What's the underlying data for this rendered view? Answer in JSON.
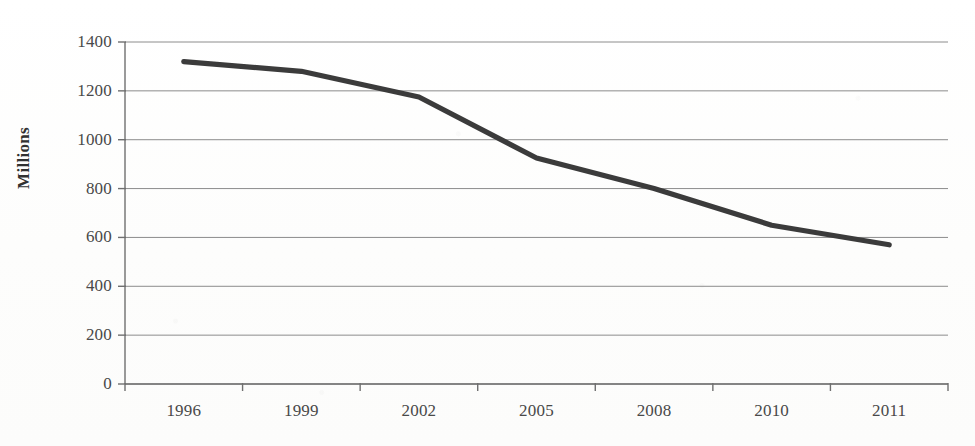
{
  "chart_data": {
    "type": "line",
    "title": "",
    "subtitle": "",
    "xlabel": "",
    "ylabel": "Millions",
    "categories": [
      "1996",
      "1999",
      "2002",
      "2005",
      "2008",
      "2010",
      "2011"
    ],
    "values": [
      1320,
      1280,
      1175,
      925,
      800,
      650,
      570
    ],
    "series": [
      {
        "name": "Millions",
        "values": [
          1320,
          1280,
          1175,
          925,
          800,
          650,
          570
        ]
      }
    ],
    "ylim": [
      0,
      1400
    ],
    "yticks": [
      0,
      200,
      400,
      600,
      800,
      1000,
      1200,
      1400
    ],
    "ytick_labels": [
      "0",
      "200",
      "400",
      "600",
      "800",
      "1000",
      "1200",
      "1400"
    ],
    "xtick_labels": [
      "1996",
      "1999",
      "2002",
      "2005",
      "2008",
      "2010",
      "2011"
    ],
    "grid": true,
    "grid_axis": "y",
    "legend": false,
    "legend_position": "none",
    "annotations": []
  },
  "style": {
    "line_color": "#3b3b3b",
    "grid_color": "#8c8c8c",
    "axis_color": "#6f6f6f",
    "label_color": "#494949",
    "background_color": "#ffffff"
  },
  "axis": {
    "y_title": "Millions"
  }
}
